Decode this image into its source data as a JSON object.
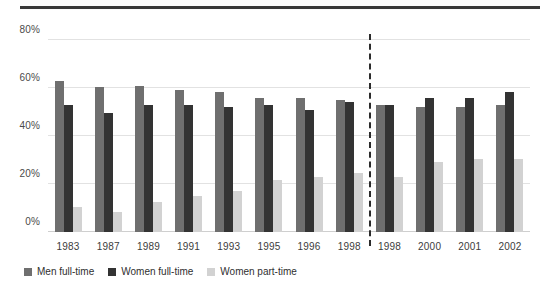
{
  "chart_data": {
    "type": "bar",
    "title": "",
    "subtitle": "",
    "xlabel": "",
    "ylabel": "",
    "ylim": [
      0,
      80
    ],
    "yticks": [
      0,
      20,
      40,
      60,
      80
    ],
    "ytick_labels": [
      "0%",
      "20%",
      "40%",
      "60%",
      "80%"
    ],
    "grid": true,
    "legend_position": "bottom-left",
    "categories": [
      "1983",
      "1987",
      "1989",
      "1991",
      "1993",
      "1995",
      "1996",
      "1998",
      "1998",
      "2000",
      "2001",
      "2002"
    ],
    "panels": [
      {
        "name": "left-panel",
        "categories": [
          "1983",
          "1987",
          "1989",
          "1991",
          "1993",
          "1995",
          "1996",
          "1998"
        ]
      },
      {
        "name": "right-panel",
        "categories": [
          "1998",
          "2000",
          "2001",
          "2002"
        ]
      }
    ],
    "divider_after_index": 7,
    "divider_style": "dashed",
    "series": [
      {
        "name": "Men full-time",
        "color": "#6f6f6f",
        "values": [
          63,
          60.5,
          61,
          59,
          58.5,
          56,
          56,
          55,
          53,
          52,
          52,
          53
        ]
      },
      {
        "name": "Women full-time",
        "color": "#333333",
        "values": [
          53,
          49.5,
          53,
          53,
          52,
          53,
          51,
          54,
          53,
          56,
          56,
          58.5
        ]
      },
      {
        "name": "Women part-time",
        "color": "#d2d2d2",
        "values": [
          10.5,
          8.5,
          12.5,
          15,
          17,
          21.5,
          23,
          24.5,
          23,
          29,
          30.5,
          30.5
        ]
      }
    ]
  },
  "legend": {
    "items": [
      {
        "label": "Men full-time",
        "color": "#6f6f6f"
      },
      {
        "label": "Women full-time",
        "color": "#333333"
      },
      {
        "label": "Women part-time",
        "color": "#d2d2d2"
      }
    ]
  }
}
